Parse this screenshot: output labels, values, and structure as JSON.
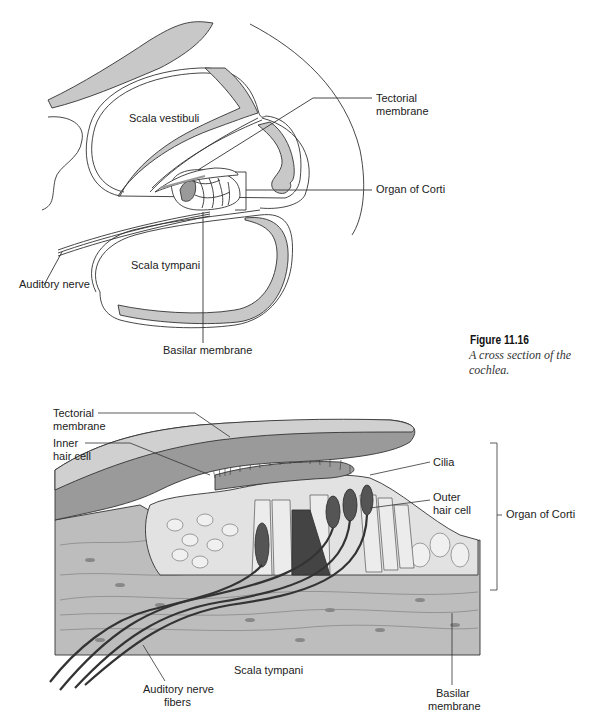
{
  "figure": {
    "number": "Figure 11.16",
    "caption": "A cross section of the cochlea."
  },
  "top_diagram": {
    "title": "Cochlea cross section",
    "labels": {
      "scala_vestibuli": "Scala vestibuli",
      "scala_tympani": "Scala tympani",
      "tectorial_membrane_1": "Tectorial",
      "tectorial_membrane_2": "membrane",
      "organ_of_corti": "Organ of Corti",
      "auditory_nerve": "Auditory nerve",
      "basilar_membrane": "Basilar membrane"
    }
  },
  "bottom_diagram": {
    "title": "Organ of Corti detail",
    "labels": {
      "tectorial_membrane_1": "Tectorial",
      "tectorial_membrane_2": "membrane",
      "inner_hair_cell_1": "Inner",
      "inner_hair_cell_2": "hair cell",
      "cilia": "Cilia",
      "outer_hair_cell_1": "Outer",
      "outer_hair_cell_2": "hair cell",
      "organ_of_corti": "Organ of Corti",
      "scala_tympani": "Scala tympani",
      "auditory_nerve_fibers_1": "Auditory nerve",
      "auditory_nerve_fibers_2": "fibers",
      "basilar_membrane_1": "Basilar",
      "basilar_membrane_2": "membrane"
    }
  },
  "colors": {
    "outline": "#333333",
    "gray_fill": "#c8c8c8",
    "mid_gray": "#9a9a9a",
    "dark_cell": "#555555",
    "light_cell": "#e2e2e2",
    "tissue": "#bdbdbd"
  }
}
